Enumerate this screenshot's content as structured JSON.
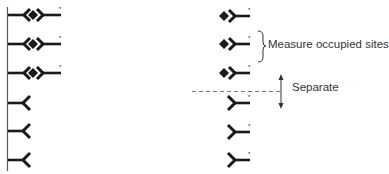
{
  "diagram": {
    "type": "competitive binding assay schematic",
    "colors": {
      "ink": "#1a1a1a",
      "membrane": "#555555",
      "dashed": "#777777",
      "text": "#333333"
    },
    "left_panel": {
      "description": "Membrane with receptors; top three bound by labeled ligand, bottom three unoccupied",
      "rows": [
        {
          "state": "occupied",
          "label_marker": "*"
        },
        {
          "state": "occupied",
          "label_marker": "*"
        },
        {
          "state": "occupied",
          "label_marker": "*"
        },
        {
          "state": "unoccupied"
        },
        {
          "state": "unoccupied"
        },
        {
          "state": "unoccupied"
        }
      ]
    },
    "right_panel": {
      "above_separator": [
        {
          "species": "bound complex",
          "label_marker": "*"
        },
        {
          "species": "bound complex",
          "label_marker": "*"
        },
        {
          "species": "bound complex",
          "label_marker": "*"
        }
      ],
      "below_separator": [
        {
          "species": "free labeled ligand",
          "label_marker": "*"
        },
        {
          "species": "free labeled ligand",
          "label_marker": "*"
        },
        {
          "species": "free labeled ligand",
          "label_marker": "*"
        }
      ]
    },
    "annotations": {
      "measure_label": "Measure occupied sites",
      "separate_label": "Separate",
      "asterisk": "*"
    }
  }
}
